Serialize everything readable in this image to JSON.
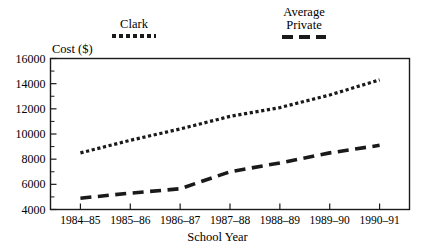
{
  "chart_data": {
    "type": "line",
    "title": "",
    "xlabel": "School Year",
    "ylabel": "Cost ($)",
    "categories": [
      "1984–85",
      "1985–86",
      "1986–87",
      "1987–88",
      "1988–89",
      "1989–90",
      "1990–91"
    ],
    "ylim": [
      4000,
      16000
    ],
    "ytick_labels": [
      "4000",
      "6000",
      "8000",
      "10000",
      "12000",
      "14000",
      "16000"
    ],
    "ytick_values": [
      4000,
      6000,
      8000,
      10000,
      12000,
      14000,
      16000
    ],
    "yminor_step": 1000,
    "grid": false,
    "legend_position": "above-plot",
    "series": [
      {
        "name": "Clark",
        "style": "dotted",
        "color": "#1a1a1a",
        "values": [
          8500,
          9500,
          10400,
          11400,
          12100,
          13100,
          14300
        ]
      },
      {
        "name": "Average Private",
        "style": "dashed",
        "color": "#1a1a1a",
        "values": [
          4900,
          5300,
          5650,
          7000,
          7700,
          8500,
          9100
        ]
      }
    ]
  },
  "legend": {
    "clark": {
      "label": "Clark",
      "swatch": "dotted-line-swatch"
    },
    "private": {
      "label_line1": "Average",
      "label_line2": "Private",
      "swatch": "dashed-line-swatch"
    }
  },
  "axes": {
    "y_title": "Cost ($)",
    "x_title": "School Year"
  }
}
